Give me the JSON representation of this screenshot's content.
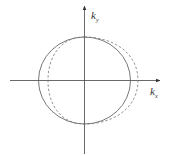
{
  "diagram": {
    "type": "k-space contour",
    "axes": {
      "x_label": "k",
      "x_subscript": "x",
      "y_label": "k",
      "y_subscript": "y"
    },
    "curves": [
      {
        "name": "solid-circle",
        "style": "solid",
        "color": "#555555"
      },
      {
        "name": "dashed-shifted-contour",
        "style": "dashed",
        "color": "#777777"
      }
    ],
    "colors": {
      "axis": "#444444",
      "background": "#ffffff"
    }
  }
}
